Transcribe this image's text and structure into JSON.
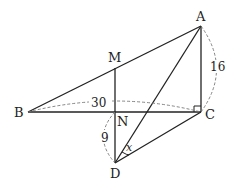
{
  "diagram": {
    "points": {
      "A": {
        "label": "A",
        "x": 201,
        "y": 26
      },
      "B": {
        "label": "B",
        "x": 28,
        "y": 112
      },
      "C": {
        "label": "C",
        "x": 201,
        "y": 112
      },
      "M": {
        "label": "M",
        "x": 115,
        "y": 68
      },
      "N": {
        "label": "N",
        "x": 115,
        "y": 112
      },
      "D": {
        "label": "D",
        "x": 115,
        "y": 163
      }
    },
    "segments": [
      "AB",
      "AC",
      "BC",
      "MN",
      "ND",
      "AD",
      "DC"
    ],
    "measurements": {
      "BC": "30",
      "AC": "16",
      "ND": "9"
    },
    "angle_label": "x",
    "right_angle_at": "C"
  }
}
